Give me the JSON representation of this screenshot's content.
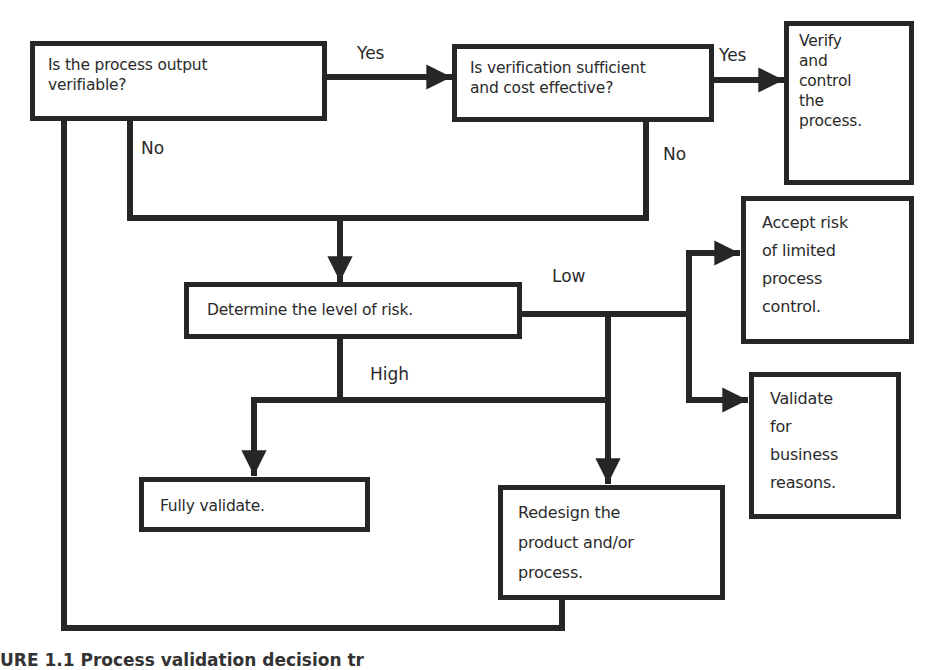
{
  "diagram": {
    "type": "flowchart",
    "nodes": {
      "q_verifiable": {
        "text": "Is the process output\nverifiable?"
      },
      "q_sufficient": {
        "text": "Is verification sufficient\nand cost effective?"
      },
      "verify_control": {
        "text": "Verify\nand\ncontrol\nthe\nprocess."
      },
      "determine_risk": {
        "text": "Determine  the level of risk."
      },
      "accept_risk": {
        "text": "Accept risk\nof limited\nprocess\ncontrol."
      },
      "validate_business": {
        "text": "Validate\nfor\nbusiness\nreasons."
      },
      "fully_validate": {
        "text": "Fully validate."
      },
      "redesign": {
        "text": "Redesign the\nproduct and/or\nprocess."
      }
    },
    "edge_labels": {
      "yes_1": "Yes",
      "yes_2": "Yes",
      "no_1": "No",
      "no_2": "No",
      "low": "Low",
      "high": "High"
    },
    "edges": [
      {
        "from": "q_verifiable",
        "to": "q_sufficient",
        "label": "Yes"
      },
      {
        "from": "q_sufficient",
        "to": "verify_control",
        "label": "Yes"
      },
      {
        "from": "q_verifiable",
        "to": "determine_risk",
        "label": "No"
      },
      {
        "from": "q_sufficient",
        "to": "determine_risk",
        "label": "No"
      },
      {
        "from": "determine_risk",
        "to": "accept_risk",
        "label": "Low"
      },
      {
        "from": "determine_risk",
        "to": "validate_business",
        "label": "Low"
      },
      {
        "from": "determine_risk",
        "to": "redesign",
        "label": "Low"
      },
      {
        "from": "determine_risk",
        "to": "fully_validate",
        "label": "High"
      },
      {
        "from": "determine_risk",
        "to": "redesign",
        "label": "High"
      },
      {
        "from": "redesign",
        "to": "q_verifiable",
        "label": ""
      }
    ],
    "caption_fragment": "URE 1.1  Process validation decision tr"
  },
  "colors": {
    "line": "#262626",
    "background": "#ffffff",
    "text": "#2a2a2a"
  }
}
